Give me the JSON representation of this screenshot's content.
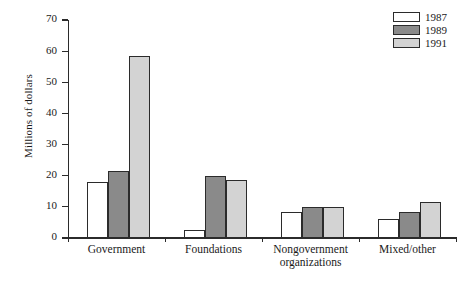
{
  "chart_data": {
    "type": "bar",
    "title": "",
    "xlabel": "",
    "ylabel": "Millions of dollars",
    "categories": [
      "Government",
      "Foundations",
      "Nongovernment organizations",
      "Mixed/other"
    ],
    "series": [
      {
        "name": "1987",
        "color": "#ffffff",
        "values": [
          18,
          2.5,
          8.5,
          6
        ]
      },
      {
        "name": "1989",
        "color": "#8a8a8a",
        "values": [
          21.5,
          20,
          10,
          8.5
        ]
      },
      {
        "name": "1991",
        "color": "#d3d3d3",
        "values": [
          58.5,
          18.5,
          10,
          11.5
        ]
      }
    ],
    "ylim": [
      0,
      70
    ],
    "ytick_values": [
      0,
      10,
      20,
      30,
      40,
      50,
      60,
      70
    ],
    "ytick_labels": [
      "0",
      "10",
      "20",
      "30",
      "40",
      "50",
      "60",
      "70"
    ],
    "grid": false,
    "legend_position": "top-right",
    "bar_edge_color": "#2b2b2b",
    "axis_color": "#2b2b2b"
  }
}
